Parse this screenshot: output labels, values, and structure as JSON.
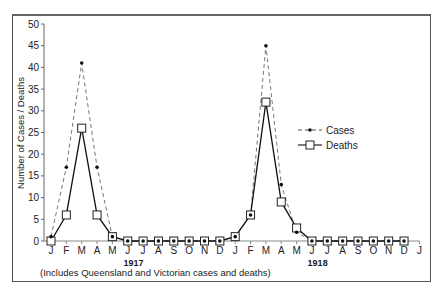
{
  "chart_data": {
    "type": "line",
    "title": "",
    "xlabel": "",
    "ylabel": "Number of Cases / Deaths",
    "ylim": [
      0,
      50
    ],
    "yticks": [
      0,
      5,
      10,
      15,
      20,
      25,
      30,
      35,
      40,
      45,
      50
    ],
    "grid": false,
    "legend_position": "right-middle",
    "categories": [
      "J",
      "F",
      "M",
      "A",
      "M",
      "J",
      "J",
      "A",
      "S",
      "O",
      "N",
      "D",
      "J",
      "F",
      "M",
      "A",
      "M",
      "J",
      "J",
      "A",
      "S",
      "O",
      "N",
      "D",
      "J"
    ],
    "year_labels": [
      {
        "label": "1917",
        "at_index": 5.5
      },
      {
        "label": "1918",
        "at_index": 17.5
      }
    ],
    "series": [
      {
        "name": "Cases",
        "style": "dashed",
        "marker": "dot",
        "values": [
          1,
          17,
          41,
          17,
          1,
          0,
          0,
          0,
          0,
          0,
          0,
          0,
          1,
          6,
          45,
          13,
          2,
          0,
          0,
          0,
          0,
          0,
          0,
          0,
          null
        ]
      },
      {
        "name": "Deaths",
        "style": "solid",
        "marker": "square",
        "values": [
          0,
          6,
          26,
          6,
          1,
          0,
          0,
          0,
          0,
          0,
          0,
          0,
          1,
          6,
          32,
          9,
          3,
          0,
          0,
          0,
          0,
          0,
          0,
          0,
          null
        ]
      }
    ],
    "annotation": "(Includes Queensland and Victorian cases and deaths)"
  }
}
